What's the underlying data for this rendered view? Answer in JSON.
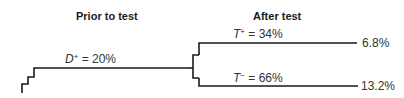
{
  "diagram": {
    "headers": {
      "prior": "Prior to test",
      "after": "After test"
    },
    "prior_branch": {
      "variable": "D",
      "superscript": "+",
      "equals": " = 20%"
    },
    "branches": [
      {
        "variable": "T",
        "superscript": "+",
        "equals": " = 34%",
        "outcome": "6.8%"
      },
      {
        "variable": "T",
        "superscript": "−",
        "equals": " = 66%",
        "outcome": "13.2%"
      }
    ],
    "line_color": "#1a1a1a"
  }
}
